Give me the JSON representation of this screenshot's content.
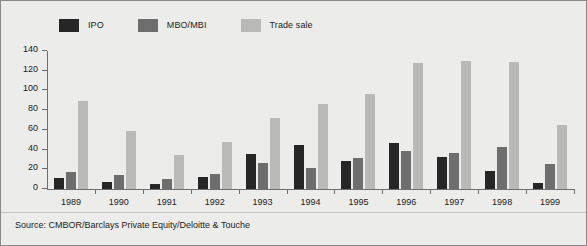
{
  "figure": {
    "background_color": "#ececeb",
    "border_color": "#8a8a8a",
    "source_note": "Source: CMBOR/Barclays Private Equity/Deloitte & Touche"
  },
  "legend": {
    "position": "top",
    "items": [
      {
        "label": "IPO",
        "color": "#262626"
      },
      {
        "label": "MBO/MBI",
        "color": "#6e6e6e"
      },
      {
        "label": "Trade sale",
        "color": "#b9b9b8"
      }
    ]
  },
  "axes": {
    "y_ticks": [
      0,
      20,
      40,
      60,
      80,
      100,
      120,
      140
    ],
    "y_min": 0,
    "y_max": 140,
    "ylabel": "",
    "xlabel": "",
    "grid": false
  },
  "chart_data": {
    "type": "bar",
    "title": "",
    "subtitle": "",
    "xlabel": "",
    "ylabel": "",
    "ylim": [
      0,
      140
    ],
    "grid": false,
    "legend_position": "top",
    "categories": [
      "1989",
      "1990",
      "1991",
      "1992",
      "1993",
      "1994",
      "1995",
      "1996",
      "1997",
      "1998",
      "1999"
    ],
    "series": [
      {
        "name": "IPO",
        "color": "#262626",
        "values": [
          11,
          7,
          5,
          12,
          36,
          45,
          28,
          47,
          32,
          18,
          6
        ]
      },
      {
        "name": "MBO/MBI",
        "color": "#6e6e6e",
        "values": [
          17,
          14,
          10,
          15,
          26,
          21,
          31,
          39,
          37,
          43,
          25
        ]
      },
      {
        "name": "Trade sale",
        "color": "#b9b9b8",
        "values": [
          89,
          59,
          35,
          48,
          72,
          86,
          96,
          128,
          130,
          129,
          65
        ]
      }
    ]
  }
}
